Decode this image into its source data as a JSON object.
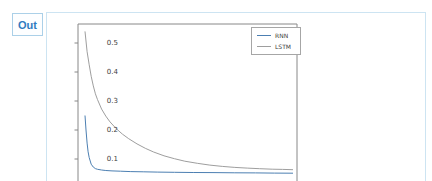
{
  "cell": {
    "out_label": "Out"
  },
  "colors": {
    "out_text": "#2f7bbf",
    "out_badge_border": "#abd0e8",
    "cell_border": "#cde4f2",
    "spine": "#888888",
    "tick_text": "#3d3d3d",
    "rnn_line": "#4c7fb2",
    "lstm_line": "#9e9e9e"
  },
  "chart_data": {
    "type": "line",
    "title": "",
    "xlabel": "",
    "ylabel": "",
    "x_axis_visible": false,
    "ylim": [
      0.02,
      0.565
    ],
    "yticks": [
      0.1,
      0.2,
      0.3,
      0.4,
      0.5
    ],
    "ytick_labels": [
      "0.1",
      "0.2",
      "0.3",
      "0.4",
      "0.5"
    ],
    "grid": false,
    "legend_position": "upper right",
    "series": [
      {
        "name": "RNN",
        "color": "#4c7fb2",
        "x": [
          0,
          0.5,
          1,
          1.5,
          2,
          3,
          4,
          5,
          6,
          8,
          10,
          13,
          17,
          22,
          28,
          35,
          43,
          52,
          62,
          72,
          82,
          91,
          100
        ],
        "y": [
          0.25,
          0.2,
          0.155,
          0.125,
          0.105,
          0.082,
          0.072,
          0.067,
          0.0645,
          0.062,
          0.0605,
          0.059,
          0.0578,
          0.0567,
          0.0558,
          0.055,
          0.0543,
          0.0536,
          0.053,
          0.0524,
          0.0519,
          0.0515,
          0.051
        ]
      },
      {
        "name": "LSTM",
        "color": "#9e9e9e",
        "x": [
          0,
          1,
          2,
          3,
          4,
          5,
          6,
          8,
          10,
          12,
          15,
          18,
          21,
          25,
          29,
          33,
          38,
          43,
          48,
          54,
          60,
          66,
          72,
          78,
          84,
          90,
          95,
          100
        ],
        "y": [
          0.54,
          0.47,
          0.425,
          0.385,
          0.352,
          0.325,
          0.305,
          0.272,
          0.248,
          0.228,
          0.205,
          0.186,
          0.17,
          0.152,
          0.137,
          0.124,
          0.111,
          0.101,
          0.0925,
          0.085,
          0.079,
          0.0745,
          0.071,
          0.0685,
          0.0665,
          0.065,
          0.064,
          0.063
        ]
      }
    ]
  }
}
